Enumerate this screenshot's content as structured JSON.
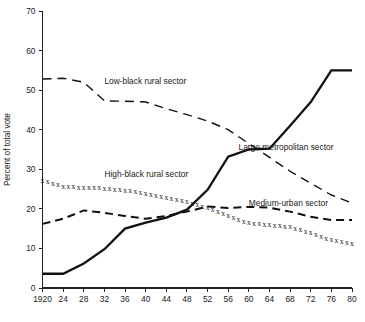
{
  "chart_data": {
    "type": "line",
    "title": "",
    "xlabel": "",
    "ylabel": "Percent of total vote",
    "xlim": [
      1920,
      1980
    ],
    "ylim": [
      0,
      70
    ],
    "grid": false,
    "legend_position": "inline-annotations",
    "x_tick_labels": [
      "1920",
      "24",
      "28",
      "32",
      "36",
      "40",
      "44",
      "48",
      "52",
      "56",
      "60",
      "64",
      "68",
      "72",
      "76",
      "80"
    ],
    "x_tick_values": [
      1920,
      1924,
      1928,
      1932,
      1936,
      1940,
      1944,
      1948,
      1952,
      1956,
      1960,
      1964,
      1968,
      1972,
      1976,
      1980
    ],
    "y_tick_labels": [
      "0",
      "10",
      "20",
      "30",
      "40",
      "50",
      "60",
      "70"
    ],
    "y_tick_values": [
      0,
      10,
      20,
      30,
      40,
      50,
      60,
      70
    ],
    "x": [
      1920,
      1924,
      1928,
      1932,
      1936,
      1940,
      1944,
      1948,
      1952,
      1956,
      1960,
      1964,
      1968,
      1972,
      1976,
      1980
    ],
    "series": [
      {
        "name": "Low-black rural sector",
        "style": "medium-dashed",
        "label_x": 1932,
        "label_y": 51.5,
        "values": [
          52.8,
          53.0,
          52.0,
          47.3,
          47.2,
          47.0,
          45.3,
          43.8,
          42.2,
          40.0,
          36.5,
          33.0,
          29.5,
          26.5,
          23.5,
          21.5
        ]
      },
      {
        "name": "High-black rural sector",
        "style": "x-markers",
        "label_x": 1932,
        "label_y": 28.0,
        "values": [
          27.2,
          25.8,
          25.5,
          25.3,
          24.8,
          24.0,
          23.0,
          21.8,
          20.4,
          18.3,
          16.5,
          16.0,
          15.5,
          14.0,
          12.2,
          11.2
        ]
      },
      {
        "name": "Medium-urban sector",
        "style": "long-dashed",
        "label_x": 1960,
        "label_y": 20.6,
        "values": [
          16.2,
          17.5,
          19.6,
          19.0,
          18.2,
          17.5,
          18.2,
          19.3,
          20.6,
          20.2,
          20.5,
          20.3,
          19.3,
          18.0,
          17.2,
          17.2
        ]
      },
      {
        "name": "Large metropolitan sector",
        "style": "solid",
        "label_x": 1958,
        "label_y": 35.0,
        "values": [
          3.6,
          3.6,
          6.2,
          9.8,
          15.0,
          16.5,
          17.8,
          19.8,
          24.8,
          33.2,
          35.0,
          35.2,
          41.0,
          47.0,
          55.0,
          55.0
        ]
      }
    ]
  }
}
